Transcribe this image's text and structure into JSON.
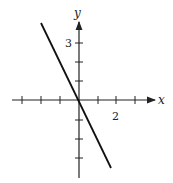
{
  "diagram": {
    "type": "line-graph",
    "equation": "y = -2x",
    "axes": {
      "x_label": "x",
      "y_label": "y",
      "x_ticks": [
        -3,
        -2,
        -1,
        1,
        2,
        3
      ],
      "y_ticks": [
        -3,
        -2,
        -1,
        1,
        2,
        3
      ],
      "x_tick_label": "2",
      "y_tick_label": "3"
    },
    "line": {
      "from": [
        -2,
        4
      ],
      "to": [
        1.7,
        -3.4
      ]
    },
    "colors": {
      "axis": "#222222",
      "line": "#111111"
    }
  }
}
